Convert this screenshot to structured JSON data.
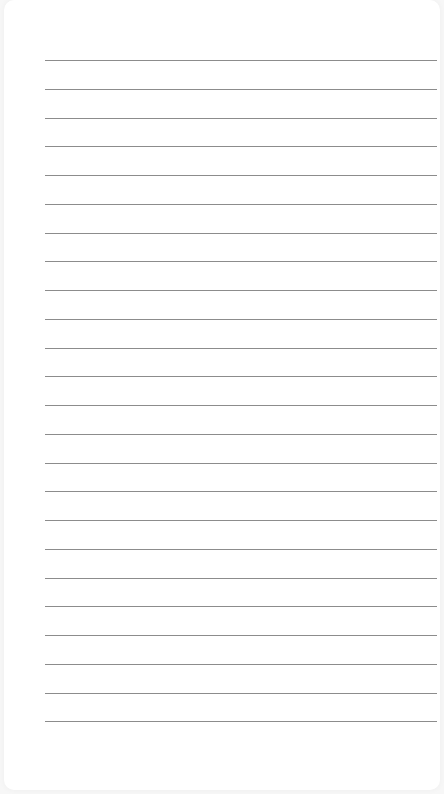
{
  "page": {
    "type": "lined-paper",
    "background_color": "#ffffff",
    "line_color": "#8c8c8c",
    "line_count": 24,
    "first_line_y": 60,
    "line_spacing": 28.75,
    "line_left": 45,
    "line_right": 437
  }
}
